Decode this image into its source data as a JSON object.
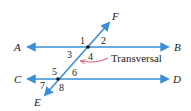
{
  "diagram": {
    "colors": {
      "line": "#3b8fd6",
      "callout_arrow": "#e0607e",
      "text": "#222222",
      "point": "#111111"
    },
    "lines": [
      {
        "id": "AB",
        "start_label": "A",
        "end_label": "B",
        "type": "line"
      },
      {
        "id": "CD",
        "start_label": "C",
        "end_label": "D",
        "type": "line"
      },
      {
        "id": "EF",
        "start_label": "E",
        "end_label": "F",
        "type": "transversal"
      }
    ],
    "labels": {
      "A": "A",
      "B": "B",
      "C": "C",
      "D": "D",
      "E": "E",
      "F": "F"
    },
    "angles": [
      "1",
      "2",
      "3",
      "4",
      "5",
      "6",
      "7",
      "8"
    ],
    "callout": "Transversal"
  }
}
